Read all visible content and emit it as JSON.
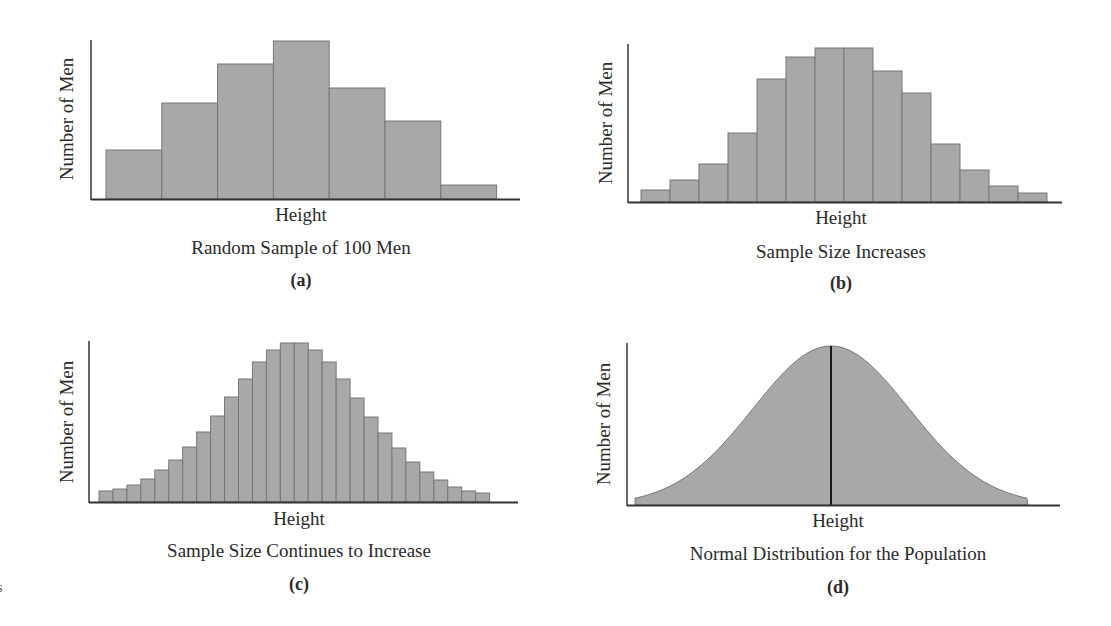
{
  "figure": {
    "bar_fill": "#a8a8a8",
    "bar_edge": "#777777",
    "axis_color": "#333333",
    "edge_fragment": "s"
  },
  "panels": [
    {
      "id": "a",
      "ylabel": "Number of Men",
      "xlabel": "Height",
      "subtitle": "Random Sample of 100 Men",
      "letter": "(a)"
    },
    {
      "id": "b",
      "ylabel": "Number of Men",
      "xlabel": "Height",
      "subtitle": "Sample Size Increases",
      "letter": "(b)"
    },
    {
      "id": "c",
      "ylabel": "Number of Men",
      "xlabel": "Height",
      "subtitle": "Sample Size Continues to Increase",
      "letter": "(c)"
    },
    {
      "id": "d",
      "ylabel": "Number of Men",
      "xlabel": "Height",
      "subtitle": "Normal Distribution for the Population",
      "letter": "(d)"
    }
  ],
  "chart_data": [
    {
      "type": "bar",
      "title": "Random Sample of 100 Men",
      "panel_label": "(a)",
      "xlabel": "Height",
      "ylabel": "Number of Men",
      "grid": false,
      "ticks": "none",
      "ylim": [
        0,
        160
      ],
      "categories": [
        "bin1",
        "bin2",
        "bin3",
        "bin4",
        "bin5",
        "bin6",
        "bin7"
      ],
      "values": [
        49,
        96,
        135,
        158,
        111,
        78,
        14
      ],
      "geometry": {
        "axis_x": 91,
        "axis_top": 40,
        "baseline": 199,
        "axis_right": 520,
        "bar_start": 106,
        "bar_width": 55.8
      }
    },
    {
      "type": "bar",
      "title": "Sample Size Increases",
      "panel_label": "(b)",
      "xlabel": "Height",
      "ylabel": "Number of Men",
      "grid": false,
      "ticks": "none",
      "ylim": [
        0,
        160
      ],
      "categories": [
        "bin1",
        "bin2",
        "bin3",
        "bin4",
        "bin5",
        "bin6",
        "bin7",
        "bin8",
        "bin9",
        "bin10",
        "bin11",
        "bin12",
        "bin13",
        "bin14"
      ],
      "values": [
        12,
        22,
        38,
        69,
        123,
        145,
        154,
        154,
        131,
        109,
        58,
        32,
        16,
        9
      ],
      "geometry": {
        "axis_x": 628,
        "axis_top": 44,
        "baseline": 202,
        "axis_right": 1062,
        "bar_start": 641,
        "bar_width": 29.0
      }
    },
    {
      "type": "bar",
      "title": "Sample Size Continues to Increase",
      "panel_label": "(c)",
      "xlabel": "Height",
      "ylabel": "Number of Men",
      "grid": false,
      "ticks": "none",
      "ylim": [
        0,
        160
      ],
      "categories": [
        "bin1",
        "bin2",
        "bin3",
        "bin4",
        "bin5",
        "bin6",
        "bin7",
        "bin8",
        "bin9",
        "bin10",
        "bin11",
        "bin12",
        "bin13",
        "bin14",
        "bin15",
        "bin16",
        "bin17",
        "bin18",
        "bin19",
        "bin20",
        "bin21",
        "bin22",
        "bin23",
        "bin24",
        "bin25",
        "bin26",
        "bin27",
        "bin28"
      ],
      "values": [
        11,
        13,
        17,
        23,
        32,
        42,
        55,
        70,
        86,
        105,
        123,
        140,
        152,
        159,
        159,
        152,
        140,
        123,
        104,
        85,
        69,
        54,
        40,
        30,
        22,
        15,
        11,
        9
      ],
      "geometry": {
        "axis_x": 89,
        "axis_top": 341,
        "baseline": 502,
        "axis_right": 518,
        "bar_start": 99,
        "bar_width": 13.95
      }
    },
    {
      "type": "area",
      "title": "Normal Distribution for the Population",
      "panel_label": "(d)",
      "xlabel": "Height",
      "ylabel": "Number of Men",
      "grid": false,
      "ticks": "none",
      "curve": "normal",
      "mean_line": true,
      "x_range_sd": [
        -2.5,
        2.5
      ],
      "peak_height": 159,
      "geometry": {
        "axis_x": 627,
        "axis_top": 343,
        "baseline": 505,
        "axis_right": 1060,
        "curve_start": 635,
        "curve_end": 1028,
        "mean_x": 831,
        "sigma_px": 78
      }
    }
  ]
}
